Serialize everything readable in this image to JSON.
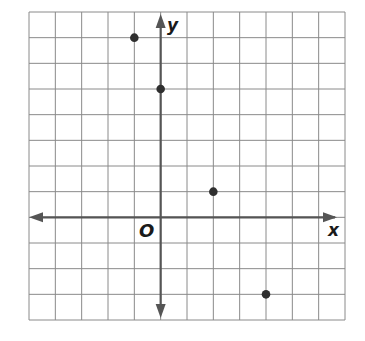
{
  "chart_data": {
    "type": "scatter",
    "title": "",
    "xlabel": "x",
    "ylabel": "y",
    "origin_label": "O",
    "xlim": [
      -5,
      7
    ],
    "ylim": [
      -4,
      8
    ],
    "grid": true,
    "grid_step": 1,
    "tick_labels": false,
    "points": [
      {
        "x": -1,
        "y": 7
      },
      {
        "x": 0,
        "y": 5
      },
      {
        "x": 2,
        "y": 1
      },
      {
        "x": 4,
        "y": -3
      }
    ]
  },
  "colors": {
    "grid": "#8a8a8a",
    "axis": "#555555",
    "point": "#2f2f2f",
    "label": "#1a1a1a"
  }
}
